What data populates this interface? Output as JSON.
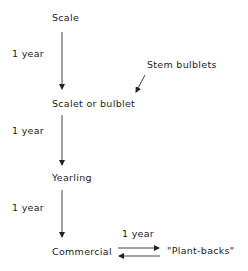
{
  "diagram": {
    "nodes": {
      "scale": "Scale",
      "scalet": "Scalet or bulblet",
      "yearling": "Yearling",
      "commercial": "Commercial",
      "plantbacks": "\"Plant-backs\"",
      "stem_bulblets": "Stem bulblets"
    },
    "edges": {
      "scale_to_scalet": "1 year",
      "scalet_to_yearling": "1 year",
      "yearling_to_commercial": "1 year",
      "commercial_plantbacks": "1 year"
    }
  }
}
